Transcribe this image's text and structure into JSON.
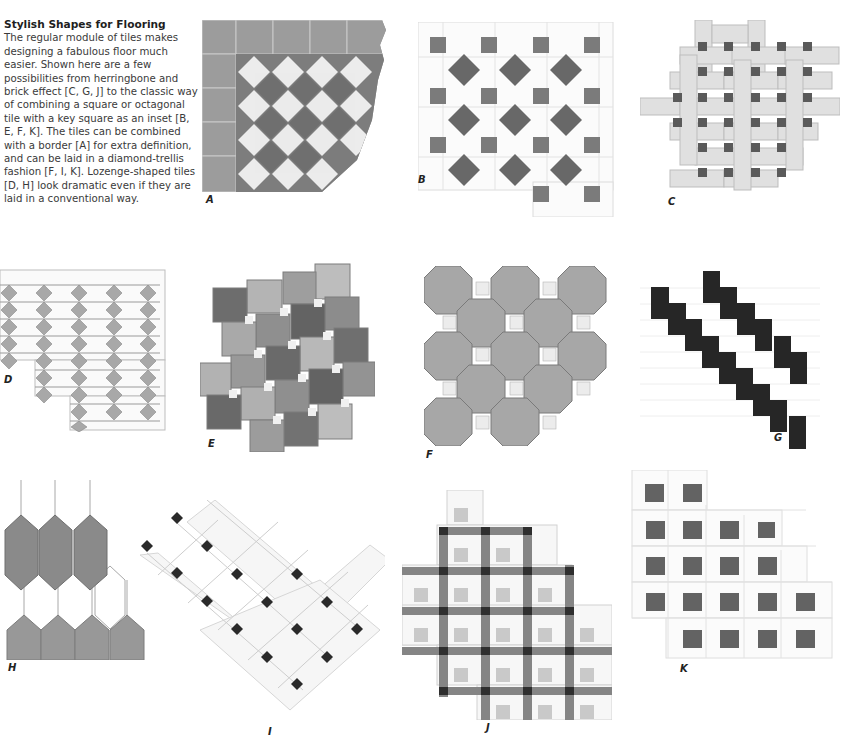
{
  "article": {
    "title": "Stylish Shapes for Flooring",
    "body": "The regular module of tiles makes designing a fabulous floor much easier. Shown here are a few possibilities from herringbone and brick effect [C, G, J] to the classic way of combining a square or octagonal tile with a key square as an inset [B, E, F, K]. The tiles can be combined with a border [A] for extra definition, and can be laid in a diamond-trellis fashion [F, I, K]. Lozenge-shaped tiles [D, H] look dramatic even if they are laid in a conventional way."
  },
  "figures": [
    {
      "id": "A",
      "label": "A",
      "pattern": "bordered-diamond-checkerboard"
    },
    {
      "id": "B",
      "label": "B",
      "pattern": "octagon-with-square-and-diamond-insets"
    },
    {
      "id": "C",
      "label": "C",
      "pattern": "basketweave-with-dark-key-squares"
    },
    {
      "id": "D",
      "label": "D",
      "pattern": "elongated-hexagon-with-diamond-inserts"
    },
    {
      "id": "E",
      "label": "E",
      "pattern": "pinwheel-squares-with-small-insets"
    },
    {
      "id": "F",
      "label": "F",
      "pattern": "octagon-with-light-key-squares"
    },
    {
      "id": "G",
      "label": "G",
      "pattern": "diagonal-brick-with-dark-accents"
    },
    {
      "id": "H",
      "label": "H",
      "pattern": "lozenge-hexagons"
    },
    {
      "id": "I",
      "label": "I",
      "pattern": "diamond-trellis-with-dark-dots"
    },
    {
      "id": "J",
      "label": "J",
      "pattern": "grid-with-dark-border-strips"
    },
    {
      "id": "K",
      "label": "K",
      "pattern": "octagon-with-dark-key-squares"
    }
  ],
  "colors": {
    "text": "#3a3a3a",
    "tile_dark": "#6e6e6e",
    "tile_mid": "#9a9a9a",
    "tile_light": "#d8d8d8",
    "tile_white": "#f4f4f4",
    "accent_black": "#2a2a2a"
  }
}
